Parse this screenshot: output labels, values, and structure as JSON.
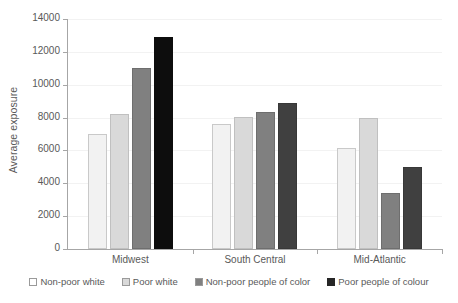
{
  "chart_data": {
    "type": "bar",
    "title": "",
    "xlabel": "",
    "ylabel": "Average exposure",
    "ylim": [
      0,
      14000
    ],
    "ytick_step": 2000,
    "yticks": [
      0,
      2000,
      4000,
      6000,
      8000,
      10000,
      12000,
      14000
    ],
    "ytick_labels": [
      "0",
      "2000",
      "4000",
      "6000",
      "8000",
      "10000",
      "12000",
      "14000"
    ],
    "grid": true,
    "legend_position": "bottom",
    "categories": [
      "Midwest",
      "South Central",
      "Mid-Atlantic"
    ],
    "series": [
      {
        "name": "Non-poor white",
        "color": "#f2f2f2",
        "values": [
          7000,
          7600,
          6150
        ]
      },
      {
        "name": "Poor white",
        "color": "#d9d9d9",
        "values": [
          8200,
          8050,
          8000
        ]
      },
      {
        "name": "Non-poor people of color",
        "color": "#808080",
        "values": [
          11000,
          8350,
          3400
        ]
      },
      {
        "name": "Poor people of colour",
        "color": "#262626",
        "values": [
          12900,
          8900,
          5000
        ]
      }
    ]
  },
  "legend": {
    "items": [
      {
        "label": "Non-poor white"
      },
      {
        "label": "Poor white"
      },
      {
        "label": "Non-poor people of color"
      },
      {
        "label": "Poor people of colour"
      }
    ]
  },
  "axis": {
    "y_title": "Average exposure"
  }
}
